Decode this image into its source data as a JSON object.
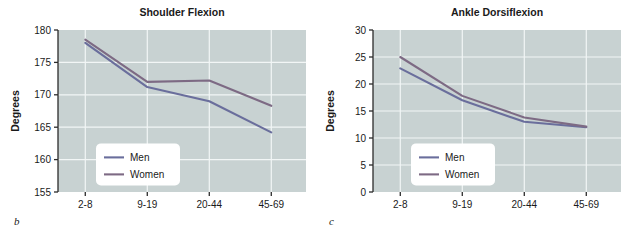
{
  "figure": {
    "panels": [
      {
        "letter": "b",
        "title": "Shoulder Flexion",
        "xlabel": "Age (years)",
        "ylabel": "Degrees",
        "legend": {
          "men": "Men",
          "women": "Women"
        }
      },
      {
        "letter": "c",
        "title": "Ankle Dorsiflexion",
        "xlabel": "Age (years)",
        "ylabel": "Degrees",
        "legend": {
          "men": "Men",
          "women": "Women"
        }
      }
    ]
  },
  "style": {
    "plot_background": "#c8d2d2",
    "gridline": "#f2f6f6",
    "men_color": "#6a6e9c",
    "women_color": "#7d6a84",
    "axis_color": "#2b2b2b",
    "legend_background": "#ffffff"
  },
  "chart_data": [
    {
      "type": "line",
      "title": "Shoulder Flexion",
      "xlabel": "Age (years)",
      "ylabel": "Degrees",
      "categories": [
        "2-8",
        "9-19",
        "20-44",
        "45-69"
      ],
      "yticks": [
        155,
        160,
        165,
        170,
        175,
        180
      ],
      "ylim": [
        155,
        180
      ],
      "grid": true,
      "legend": "inside-lower-left",
      "series": [
        {
          "name": "Men",
          "values": [
            178.0,
            171.2,
            169.0,
            164.2
          ]
        },
        {
          "name": "Women",
          "values": [
            178.5,
            172.0,
            172.2,
            168.3
          ]
        }
      ]
    },
    {
      "type": "line",
      "title": "Ankle Dorsiflexion",
      "xlabel": "Age (years)",
      "ylabel": "Degrees",
      "categories": [
        "2-8",
        "9-19",
        "20-44",
        "45-69"
      ],
      "yticks": [
        0,
        5,
        10,
        15,
        20,
        25,
        30
      ],
      "ylim": [
        0,
        30
      ],
      "grid": true,
      "legend": "inside-lower-left",
      "series": [
        {
          "name": "Men",
          "values": [
            22.9,
            17.0,
            13.0,
            12.0
          ]
        },
        {
          "name": "Women",
          "values": [
            25.0,
            17.8,
            13.8,
            12.1
          ]
        }
      ]
    }
  ]
}
